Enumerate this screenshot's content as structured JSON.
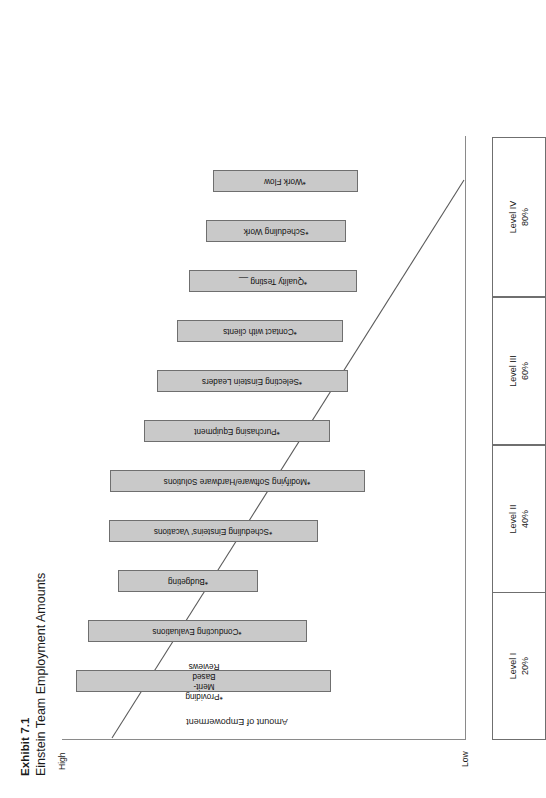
{
  "exhibit": {
    "number": "Exhibit 7.1",
    "title": "Einstein Team Employment Amounts"
  },
  "axis": {
    "y_label": "Amount of Empowerment",
    "y_high": "High",
    "y_low": "Low"
  },
  "levels": [
    {
      "name": "Level I",
      "percent": "20%"
    },
    {
      "name": "Level II",
      "percent": "40%"
    },
    {
      "name": "Level III",
      "percent": "60%"
    },
    {
      "name": "Level IV",
      "percent": "80%"
    }
  ],
  "chart_data": {
    "type": "bar",
    "title": "Einstein Team Employment Amounts",
    "subtitle": "Exhibit 7.1",
    "xlabel": "",
    "ylabel": "Amount of Empowerment",
    "ylim_labels": [
      "Low",
      "High"
    ],
    "grid": false,
    "legend": "none",
    "annotations": [
      "Diagonal line descends from high empowerment at left to low empowerment at right",
      "Asterisk (*) prefixes every task label"
    ],
    "categories": [
      "*Providing Merit-Based Reviews",
      "*Conducting Evaluations",
      "*Budgeting",
      "*Scheduling Einsteins' Vacations",
      "*Modifying Software/Hardware Solutions",
      "*Purchasing Equipment",
      "*Selecting Einstein Leaders",
      "*Contact with clients",
      "*Quality Testing __",
      "*Scheduling Work",
      "*Work Flow"
    ],
    "values": [
      100,
      86,
      55,
      82,
      100,
      73,
      75,
      65,
      66,
      55,
      57
    ],
    "offsets": [
      0,
      9,
      32,
      25,
      26,
      52,
      62,
      78,
      87,
      100,
      105
    ],
    "bars": [
      {
        "label": "*Providing Merit-Based Reviews",
        "level": "Level IV",
        "top": 0,
        "height": 100,
        "two_line": true
      },
      {
        "label": "*Conducting Evaluations",
        "level": "Level IV",
        "top": 9,
        "height": 86,
        "two_line": false
      },
      {
        "label": "*Budgeting",
        "level": "Level IV",
        "top": 32,
        "height": 55,
        "two_line": false
      },
      {
        "label": "*Scheduling Einsteins' Vacations",
        "level": "Level III",
        "top": 25,
        "height": 82,
        "two_line": false
      },
      {
        "label": "*Modifying Software/Hardware Solutions",
        "level": "Level III",
        "top": 26,
        "height": 100,
        "two_line": false
      },
      {
        "label": "*Purchasing Equipment",
        "level": "Level III",
        "top": 52,
        "height": 73,
        "two_line": false
      },
      {
        "label": "*Selecting Einstein Leaders",
        "level": "Level II",
        "top": 62,
        "height": 75,
        "two_line": false
      },
      {
        "label": "*Contact with clients",
        "level": "Level II",
        "top": 78,
        "height": 65,
        "two_line": false
      },
      {
        "label": "*Quality Testing __",
        "level": "Level II",
        "top": 87,
        "height": 66,
        "two_line": false
      },
      {
        "label": "*Scheduling Work",
        "level": "Level I",
        "top": 100,
        "height": 55,
        "two_line": false
      },
      {
        "label": "*Work Flow",
        "level": "Level I",
        "top": 105,
        "height": 57,
        "two_line": false
      }
    ],
    "level_axis": [
      {
        "name": "Level I",
        "percent": "20%"
      },
      {
        "name": "Level II",
        "percent": "40%"
      },
      {
        "name": "Level III",
        "percent": "60%"
      },
      {
        "name": "Level IV",
        "percent": "80%"
      }
    ]
  },
  "colors": {
    "bar_fill": "#c9c9c9",
    "bar_stroke": "#6f6f6f",
    "axis": "#8a8a8a",
    "line": "#5a5a5a",
    "text": "#1a1a1a",
    "background": "#ffffff"
  }
}
